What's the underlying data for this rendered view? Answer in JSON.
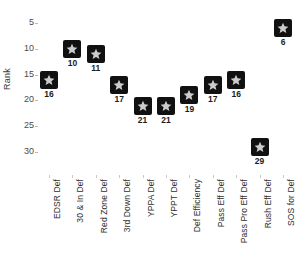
{
  "chart_data": {
    "type": "scatter",
    "title": "",
    "subtitle": "",
    "xlabel": "",
    "ylabel": "Rank",
    "categories": [
      "EDSR Def",
      "30 & In Def",
      "Red Zone Def",
      "3rd Down Def",
      "YPPA Def",
      "YPPT Def",
      "Def Efficiency",
      "Pass Eff Def",
      "Pass Pro Eff Def",
      "Rush Eff Def",
      "SOS for Def"
    ],
    "values": [
      16,
      10,
      11,
      17,
      21,
      21,
      19,
      17,
      16,
      29,
      6
    ],
    "point_labels": [
      "16",
      "10",
      "11",
      "17",
      "21",
      "21",
      "19",
      "17",
      "16",
      "29",
      "6"
    ],
    "yticks": [
      5,
      10,
      15,
      20,
      25,
      30
    ],
    "ytick_labels": [
      "5",
      "10",
      "15",
      "20",
      "25",
      "30"
    ],
    "ylim": [
      2.5,
      32.5
    ],
    "y_axis_inverted": true,
    "grid": false,
    "legend": false,
    "legend_position": "none",
    "marker": {
      "shape": "star-in-square",
      "box_color": "#111111",
      "star_color": "#cccccc"
    },
    "colors": {
      "background": "#ffffff",
      "axis_text": "#4a4a4a",
      "label_text": "#2e2e2e",
      "tick_mark": "#c9c9c9"
    }
  }
}
